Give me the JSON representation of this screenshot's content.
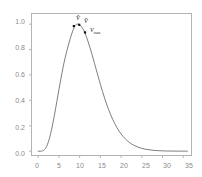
{
  "chart_data": {
    "type": "line",
    "title": "",
    "subtitle": "",
    "xlabel": "",
    "ylabel": "",
    "xlim": [
      -1.5,
      37
    ],
    "ylim": [
      -0.03,
      1.08
    ],
    "grid": false,
    "legend": null,
    "x_ticks": [
      0,
      5,
      10,
      15,
      20,
      25,
      30,
      35
    ],
    "x_tick_labels": [
      "0",
      "5",
      "10",
      "15",
      "20",
      "25",
      "30",
      "35"
    ],
    "y_ticks": [
      0.0,
      0.2,
      0.4,
      0.6,
      0.8,
      1.0
    ],
    "y_tick_labels": [
      "0.0",
      "0.2",
      "0.4",
      "0.6",
      "0.8",
      "1.0"
    ],
    "series": [
      {
        "name": "distribution",
        "color": "#6e6e6e",
        "x": [
          0,
          0.5,
          1,
          1.5,
          2,
          2.5,
          3,
          3.5,
          4,
          4.5,
          5,
          5.5,
          6,
          6.5,
          7,
          7.5,
          8,
          8.5,
          9,
          9.5,
          10,
          10.5,
          11,
          11.5,
          12,
          12.5,
          13,
          13.5,
          14,
          15,
          16,
          17,
          18,
          19,
          20,
          21,
          22,
          23,
          24,
          25,
          26,
          27,
          28,
          29,
          30,
          31,
          32,
          33,
          34,
          35,
          36
        ],
        "values": [
          0.0,
          0.0,
          0.002,
          0.012,
          0.036,
          0.078,
          0.138,
          0.214,
          0.3,
          0.392,
          0.485,
          0.575,
          0.66,
          0.735,
          0.8,
          0.86,
          0.915,
          0.96,
          0.993,
          1.0,
          0.995,
          0.978,
          0.95,
          0.912,
          0.866,
          0.815,
          0.76,
          0.702,
          0.643,
          0.527,
          0.42,
          0.327,
          0.249,
          0.186,
          0.136,
          0.098,
          0.069,
          0.048,
          0.033,
          0.022,
          0.015,
          0.01,
          0.0065,
          0.0042,
          0.0027,
          0.0017,
          0.0011,
          0.0007,
          0.0004,
          0.0003,
          0.0002
        ]
      }
    ],
    "markers": [
      {
        "id": "v-hat",
        "label": "V̂",
        "sublabel": "",
        "x": 8.6,
        "y": 0.985
      },
      {
        "id": "v-bar",
        "label": "V̄",
        "sublabel": "",
        "x": 9.9,
        "y": 0.995
      },
      {
        "id": "v-max",
        "label": "V",
        "sublabel": "max",
        "x": 11.3,
        "y": 0.935
      }
    ],
    "annotations": [
      {
        "id": "v-hat-label",
        "text": "V̂"
      },
      {
        "id": "v-bar-label",
        "text": "V̄"
      },
      {
        "id": "v-max-label",
        "text": "V"
      }
    ]
  },
  "axes": {
    "frame_color": "#b4b4b4",
    "tick_color": "#b4b4b4",
    "label_color": "#8a8a8a",
    "background": "#ffffff"
  }
}
